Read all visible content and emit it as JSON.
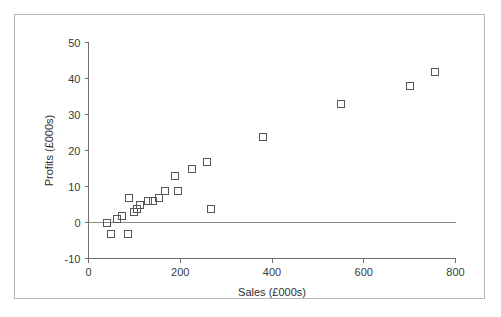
{
  "caption": "...s for decision makers",
  "figure": {
    "background_color": "#ffffff",
    "border_color": "#b6b6b6",
    "marker_color": "#55565a",
    "axis_color": "#6f6f6f",
    "zero_line_color": "#8a8a8a"
  },
  "chart_data": {
    "type": "scatter",
    "title": "",
    "xlabel": "Sales (£000s)",
    "ylabel": "Profits (£000s)",
    "xlim": [
      0,
      800
    ],
    "ylim": [
      -10,
      50
    ],
    "xticks": [
      0,
      200,
      400,
      600,
      800
    ],
    "yticks": [
      -10,
      0,
      10,
      20,
      30,
      40,
      50
    ],
    "xticklabels": [
      "0",
      "200",
      "400",
      "600",
      "800"
    ],
    "yticklabels": [
      "-10",
      "0",
      "10",
      "20",
      "30",
      "40",
      "50"
    ],
    "grid": false,
    "legend": null,
    "zero_reference_line": 0,
    "marker_shape": "square-open",
    "points": [
      {
        "x": 40,
        "y": 0
      },
      {
        "x": 48,
        "y": -3
      },
      {
        "x": 60,
        "y": 1
      },
      {
        "x": 72,
        "y": 2
      },
      {
        "x": 85,
        "y": -3
      },
      {
        "x": 88,
        "y": 7
      },
      {
        "x": 98,
        "y": 3
      },
      {
        "x": 105,
        "y": 4
      },
      {
        "x": 112,
        "y": 5
      },
      {
        "x": 128,
        "y": 6
      },
      {
        "x": 140,
        "y": 6
      },
      {
        "x": 152,
        "y": 7
      },
      {
        "x": 165,
        "y": 9
      },
      {
        "x": 188,
        "y": 13
      },
      {
        "x": 195,
        "y": 9
      },
      {
        "x": 225,
        "y": 15
      },
      {
        "x": 258,
        "y": 17
      },
      {
        "x": 265,
        "y": 4
      },
      {
        "x": 380,
        "y": 24
      },
      {
        "x": 550,
        "y": 33
      },
      {
        "x": 700,
        "y": 38
      },
      {
        "x": 755,
        "y": 42
      }
    ]
  }
}
